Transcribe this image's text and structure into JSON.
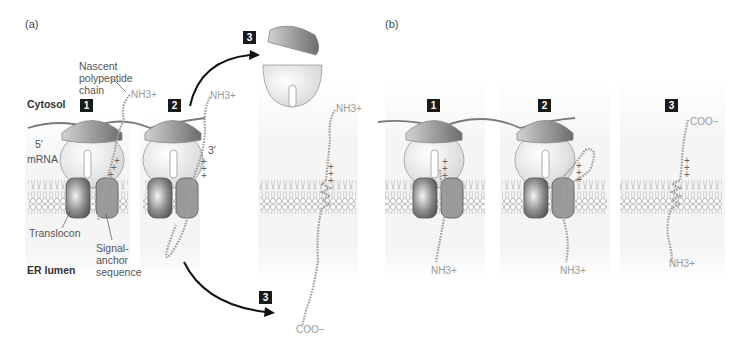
{
  "figure": {
    "panels": [
      {
        "id": "a",
        "label": "(a)",
        "steps": [
          {
            "number": "1"
          },
          {
            "number": "2"
          },
          {
            "number": "3",
            "variant": "upper"
          },
          {
            "number": "3",
            "variant": "lower"
          }
        ],
        "labels": {
          "cytosol": "Cytosol",
          "er_lumen": "ER lumen",
          "nascent_line1": "Nascent",
          "nascent_line2": "polypeptide",
          "nascent_line3": "chain",
          "five_prime": "5′",
          "mrna": "mRNA",
          "three_prime": "3′",
          "translocon": "Translocon",
          "signal_line1": "Signal-",
          "signal_line2": "anchor",
          "signal_line3": "sequence"
        },
        "termini": {
          "step1_n": "NH3+",
          "step2_n": "NH3+",
          "step3_n": "NH3+",
          "step3_c": "COO−"
        }
      },
      {
        "id": "b",
        "label": "(b)",
        "steps": [
          {
            "number": "1"
          },
          {
            "number": "2"
          },
          {
            "number": "3"
          }
        ],
        "termini": {
          "step1_n": "NH3+",
          "step2_n": "NH3+",
          "step3_n": "NH3+",
          "step3_c": "COO−"
        }
      }
    ],
    "charges": "+",
    "colors": {
      "membrane": "#c8c8c8",
      "ribosome_small": "#ededed",
      "ribosome_large": "#9a9a9a",
      "translocon": "#7d7d7d",
      "chain": "#9e9e9e",
      "arrow": "#111111",
      "step_badge": "#1a1a1a",
      "panel_bg": "#f4f4f4"
    }
  }
}
